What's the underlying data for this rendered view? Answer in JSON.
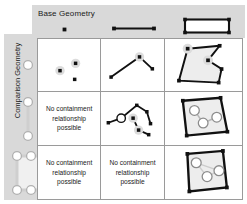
{
  "figure": {
    "column_header_title": "Base Geometry",
    "row_header_title": "Comparison Geometry",
    "no_relation_text": "No containment relationship possible",
    "colors": {
      "band_gray": "#d9d9d9",
      "grid_line": "#9a9a9a",
      "stroke_black": "#111111",
      "polygon_fill": "#ededed",
      "highlight_circle_fill": "#dcdcdc",
      "hollow_circle_fill": "#ffffff",
      "text": "#1a1a1a"
    }
  },
  "columns": [
    {
      "key": "point",
      "icon": "point-icon"
    },
    {
      "key": "line",
      "icon": "line-icon"
    },
    {
      "key": "polygon",
      "icon": "polygon-icon"
    }
  ],
  "rows": [
    {
      "key": "point",
      "icon": "point-icon"
    },
    {
      "key": "line",
      "icon": "line-icon"
    },
    {
      "key": "polygon",
      "icon": "polygon-icon"
    }
  ],
  "cells": [
    {
      "row": "point",
      "col": "point",
      "kind": "diagram",
      "label": "points-in-point"
    },
    {
      "row": "point",
      "col": "line",
      "kind": "diagram",
      "label": "points-on-line"
    },
    {
      "row": "point",
      "col": "polygon",
      "kind": "diagram",
      "label": "points-in-polygon"
    },
    {
      "row": "line",
      "col": "point",
      "kind": "text",
      "label": "no-containment"
    },
    {
      "row": "line",
      "col": "line",
      "kind": "diagram",
      "label": "line-on-line"
    },
    {
      "row": "line",
      "col": "polygon",
      "kind": "diagram",
      "label": "line-in-polygon"
    },
    {
      "row": "polygon",
      "col": "point",
      "kind": "text",
      "label": "no-containment"
    },
    {
      "row": "polygon",
      "col": "line",
      "kind": "text",
      "label": "no-containment"
    },
    {
      "row": "polygon",
      "col": "polygon",
      "kind": "diagram",
      "label": "polygon-in-polygon"
    }
  ]
}
